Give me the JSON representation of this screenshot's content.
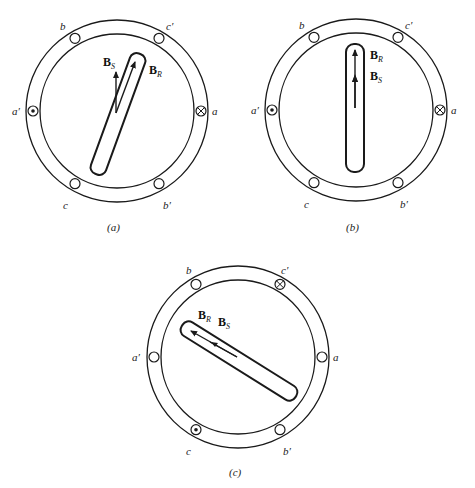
{
  "figure": {
    "stroke_color": "#1a1a1a",
    "background": "#ffffff"
  },
  "diagrams": [
    {
      "id": "a",
      "caption": "(a)",
      "slot_labels": {
        "a": "a",
        "a_prime": "a′",
        "b": "b",
        "b_prime": "b′",
        "c": "c",
        "c_prime": "c′"
      },
      "current_marks": {
        "a": "into-page (⊗)",
        "a_prime": "out-of-page (⊙)"
      },
      "vectors": [
        {
          "name": "B",
          "sub": "S"
        },
        {
          "name": "B",
          "sub": "R"
        }
      ],
      "rotor_angle_deg_from_vertical": 20
    },
    {
      "id": "b",
      "caption": "(b)",
      "slot_labels": {
        "a": "a",
        "a_prime": "a′",
        "b": "b",
        "b_prime": "b′",
        "c": "c",
        "c_prime": "c′"
      },
      "current_marks": {
        "a": "into-page (⊗)",
        "a_prime": "out-of-page (⊙)"
      },
      "vectors": [
        {
          "name": "B",
          "sub": "R"
        },
        {
          "name": "B",
          "sub": "S"
        }
      ],
      "rotor_angle_deg_from_vertical": 0
    },
    {
      "id": "c",
      "caption": "(c)",
      "slot_labels": {
        "a": "a",
        "a_prime": "a′",
        "b": "b",
        "b_prime": "b′",
        "c": "c",
        "c_prime": "c′"
      },
      "current_marks": {
        "c_prime": "into-page (⊗)",
        "c": "out-of-page (⊙)"
      },
      "vectors": [
        {
          "name": "B",
          "sub": "R"
        },
        {
          "name": "B",
          "sub": "S"
        }
      ],
      "rotor_angle_deg_from_vertical": -58
    }
  ]
}
